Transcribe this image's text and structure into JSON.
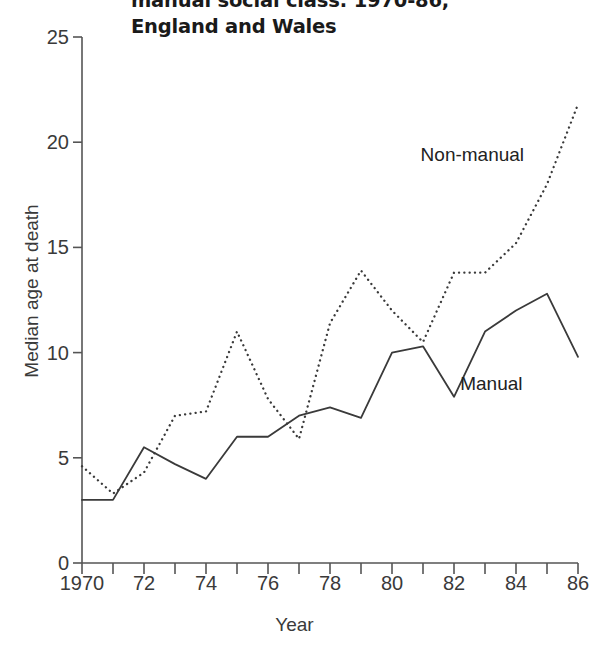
{
  "chart_data": {
    "type": "line",
    "title": "manual social class: 1970-86,\nEngland and Wales",
    "title_line1": "manual social class: 1970-86,",
    "title_line2": "England and Wales",
    "xlabel": "Year",
    "ylabel": "Median age at death",
    "xlim": [
      1970,
      1986
    ],
    "ylim": [
      0,
      25
    ],
    "grid": false,
    "legend_position": "inline-annotations",
    "x": [
      1970,
      1971,
      1972,
      1973,
      1974,
      1975,
      1976,
      1977,
      1978,
      1979,
      1980,
      1981,
      1982,
      1983,
      1984,
      1985,
      1986
    ],
    "y_ticks": [
      "0",
      "5",
      "10",
      "15",
      "20",
      "25"
    ],
    "y_tick_values": [
      0,
      5,
      10,
      15,
      20,
      25
    ],
    "x_ticks": [
      "1970",
      "72",
      "74",
      "76",
      "78",
      "80",
      "82",
      "84",
      "86"
    ],
    "x_tick_values": [
      1970,
      1972,
      1974,
      1976,
      1978,
      1980,
      1982,
      1984,
      1986
    ],
    "x_minor_tick_values": [
      1971,
      1973,
      1975,
      1977,
      1979,
      1981,
      1983,
      1985
    ],
    "series": [
      {
        "name": "Non-manual",
        "style": "dotted",
        "color": "#3a3a3a",
        "label_x": 1982.6,
        "label_y": 19.4,
        "values": [
          4.6,
          3.3,
          4.3,
          7.0,
          7.2,
          11.0,
          7.8,
          5.9,
          11.4,
          13.9,
          12.0,
          10.5,
          13.8,
          13.8,
          15.2,
          18.0,
          21.8
        ]
      },
      {
        "name": "Manual",
        "style": "solid",
        "color": "#3a3a3a",
        "label_x": 1983.2,
        "label_y": 8.5,
        "values": [
          3.0,
          3.0,
          5.5,
          4.7,
          4.0,
          6.0,
          6.0,
          7.0,
          7.4,
          6.9,
          10.0,
          10.3,
          7.9,
          11.0,
          12.0,
          12.8,
          9.8
        ]
      }
    ]
  },
  "axes": {
    "background": "#ffffff",
    "axis_color": "#555555",
    "text_color": "#3a3a3a"
  }
}
